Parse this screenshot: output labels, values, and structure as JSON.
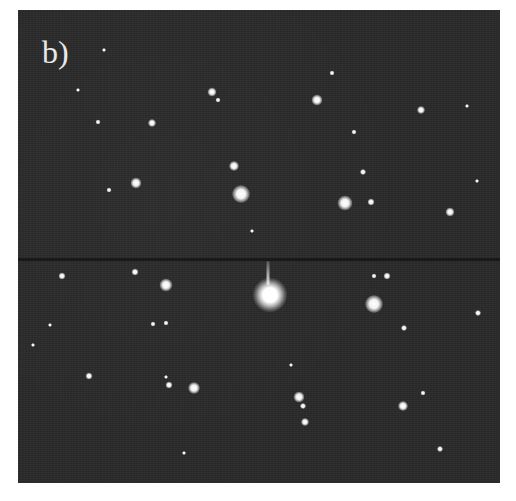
{
  "figure": {
    "panel_label": "b)",
    "colors": {
      "background": "#2a2a2a",
      "spot": "#ffffff",
      "page": "#ffffff"
    },
    "spots": [
      {
        "x": 252,
        "y": 285,
        "r": 34,
        "kind": "central"
      },
      {
        "x": 223,
        "y": 184,
        "r": 18
      },
      {
        "x": 356,
        "y": 294,
        "r": 18
      },
      {
        "x": 327,
        "y": 193,
        "r": 15
      },
      {
        "x": 148,
        "y": 275,
        "r": 13
      },
      {
        "x": 176,
        "y": 378,
        "r": 12
      },
      {
        "x": 281,
        "y": 387,
        "r": 11
      },
      {
        "x": 118,
        "y": 173,
        "r": 11
      },
      {
        "x": 299,
        "y": 90,
        "r": 11
      },
      {
        "x": 216,
        "y": 156,
        "r": 10
      },
      {
        "x": 194,
        "y": 82,
        "r": 9
      },
      {
        "x": 432,
        "y": 202,
        "r": 9
      },
      {
        "x": 385,
        "y": 396,
        "r": 10
      },
      {
        "x": 403,
        "y": 100,
        "r": 8
      },
      {
        "x": 134,
        "y": 113,
        "r": 8
      },
      {
        "x": 117,
        "y": 262,
        "r": 7
      },
      {
        "x": 287,
        "y": 412,
        "r": 8
      },
      {
        "x": 353,
        "y": 192,
        "r": 7
      },
      {
        "x": 71,
        "y": 366,
        "r": 7
      },
      {
        "x": 44,
        "y": 266,
        "r": 7
      },
      {
        "x": 151,
        "y": 375,
        "r": 7
      },
      {
        "x": 369,
        "y": 266,
        "r": 7
      },
      {
        "x": 386,
        "y": 318,
        "r": 6
      },
      {
        "x": 460,
        "y": 303,
        "r": 6
      },
      {
        "x": 345,
        "y": 162,
        "r": 6
      },
      {
        "x": 285,
        "y": 396,
        "r": 6
      },
      {
        "x": 80,
        "y": 112,
        "r": 5
      },
      {
        "x": 91,
        "y": 180,
        "r": 5
      },
      {
        "x": 135,
        "y": 314,
        "r": 5
      },
      {
        "x": 148,
        "y": 313,
        "r": 5
      },
      {
        "x": 356,
        "y": 266,
        "r": 5
      },
      {
        "x": 314,
        "y": 63,
        "r": 5
      },
      {
        "x": 200,
        "y": 90,
        "r": 5
      },
      {
        "x": 336,
        "y": 122,
        "r": 5
      },
      {
        "x": 405,
        "y": 383,
        "r": 5
      },
      {
        "x": 422,
        "y": 439,
        "r": 6
      },
      {
        "x": 148,
        "y": 367,
        "r": 4
      },
      {
        "x": 166,
        "y": 443,
        "r": 4
      },
      {
        "x": 32,
        "y": 315,
        "r": 4
      },
      {
        "x": 234,
        "y": 221,
        "r": 4
      },
      {
        "x": 449,
        "y": 96,
        "r": 4
      },
      {
        "x": 459,
        "y": 171,
        "r": 4
      },
      {
        "x": 273,
        "y": 355,
        "r": 4
      },
      {
        "x": 86,
        "y": 40,
        "r": 4
      },
      {
        "x": 60,
        "y": 80,
        "r": 4
      },
      {
        "x": 15,
        "y": 335,
        "r": 4
      }
    ],
    "streaks": [
      {
        "x": 250,
        "y": 251
      }
    ]
  }
}
